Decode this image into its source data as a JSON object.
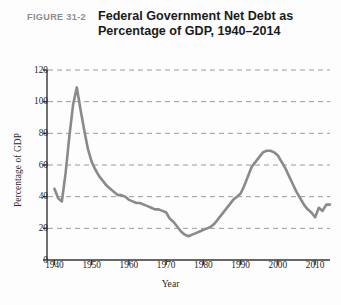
{
  "figure": {
    "number_label": "FIGURE 31-2",
    "title_line1": "Federal Government Net Debt as",
    "title_line2": "Percentage of GDP, 1940–2014",
    "number_color": "#8d8d8d",
    "title_color": "#1b1b1b"
  },
  "chart_data": {
    "type": "line",
    "title": "Federal Government Net Debt as Percentage of GDP, 1940–2014",
    "xlabel": "Year",
    "ylabel": "Percentage of GDP",
    "xlim": [
      1938,
      2014
    ],
    "ylim": [
      0,
      120
    ],
    "ytick_labels": [
      "0",
      "20",
      "40",
      "60",
      "80",
      "100",
      "120"
    ],
    "yticks": [
      0,
      20,
      40,
      60,
      80,
      100,
      120
    ],
    "xtick_labels": [
      "1940",
      "1950",
      "1960",
      "1970",
      "1980",
      "1990",
      "2000",
      "2010"
    ],
    "xticks": [
      1940,
      1950,
      1960,
      1970,
      1980,
      1990,
      2000,
      2010
    ],
    "grid": "horizontal-dashed",
    "grid_color": "#9a9a9a",
    "legend": null,
    "line_color": "#8a8a8a",
    "line_width": 2.6,
    "series": [
      {
        "name": "Federal government net debt (% of GDP)",
        "x": [
          1940,
          1941,
          1942,
          1943,
          1944,
          1945,
          1946,
          1947,
          1948,
          1949,
          1950,
          1951,
          1952,
          1953,
          1954,
          1955,
          1956,
          1957,
          1958,
          1959,
          1960,
          1961,
          1962,
          1963,
          1964,
          1965,
          1966,
          1967,
          1968,
          1969,
          1970,
          1971,
          1972,
          1973,
          1974,
          1975,
          1976,
          1977,
          1978,
          1979,
          1980,
          1981,
          1982,
          1983,
          1984,
          1985,
          1986,
          1987,
          1988,
          1989,
          1990,
          1991,
          1992,
          1993,
          1994,
          1995,
          1996,
          1997,
          1998,
          1999,
          2000,
          2001,
          2002,
          2003,
          2004,
          2005,
          2006,
          2007,
          2008,
          2009,
          2010,
          2011,
          2012,
          2013,
          2014
        ],
        "values": [
          45,
          39,
          37,
          55,
          78,
          98,
          109,
          95,
          82,
          70,
          62,
          57,
          53,
          50,
          47,
          45,
          43,
          41,
          41,
          40,
          38,
          37,
          36,
          36,
          35,
          34,
          33,
          32,
          32,
          31,
          30,
          26,
          24,
          21,
          18,
          16,
          15,
          16,
          17,
          18,
          19,
          20,
          21,
          23,
          26,
          29,
          32,
          35,
          38,
          40,
          42,
          47,
          53,
          59,
          62,
          65,
          68,
          69,
          69,
          68,
          66,
          62,
          58,
          53,
          48,
          43,
          39,
          35,
          32,
          30,
          27,
          33,
          31,
          35,
          35
        ]
      }
    ],
    "annotations": {
      "wartime_peak_year": 1946,
      "wartime_peak_value": 109,
      "trough_year": 1976,
      "trough_value": 15,
      "secondary_peak_year": 1997,
      "secondary_peak_value": 69,
      "final_value": 35
    }
  }
}
